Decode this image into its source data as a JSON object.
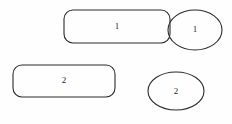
{
  "canvas": {
    "width": 232,
    "height": 124,
    "background_color": "#fefefe",
    "stroke_color": "#2b2b2b",
    "label_color": "#1f1f1f"
  },
  "diagram": {
    "type": "shape-diagram",
    "shapes": [
      {
        "id": "rounded-rect-top",
        "kind": "rounded-rectangle",
        "label": "1",
        "x": 64,
        "y": 10,
        "width": 106,
        "height": 33,
        "corner_radius": 9,
        "label_x": 117,
        "label_y": 27
      },
      {
        "id": "ellipse-top",
        "kind": "ellipse",
        "label": "1",
        "cx": 195,
        "cy": 30,
        "rx": 27,
        "ry": 20,
        "label_x": 195,
        "label_y": 30
      },
      {
        "id": "rounded-rect-bottom",
        "kind": "rounded-rectangle",
        "label": "2",
        "x": 13,
        "y": 65,
        "width": 102,
        "height": 32,
        "corner_radius": 9,
        "label_x": 64,
        "label_y": 81
      },
      {
        "id": "ellipse-bottom",
        "kind": "ellipse",
        "label": "2",
        "cx": 176,
        "cy": 91,
        "rx": 28,
        "ry": 19,
        "label_x": 176,
        "label_y": 92
      }
    ]
  }
}
